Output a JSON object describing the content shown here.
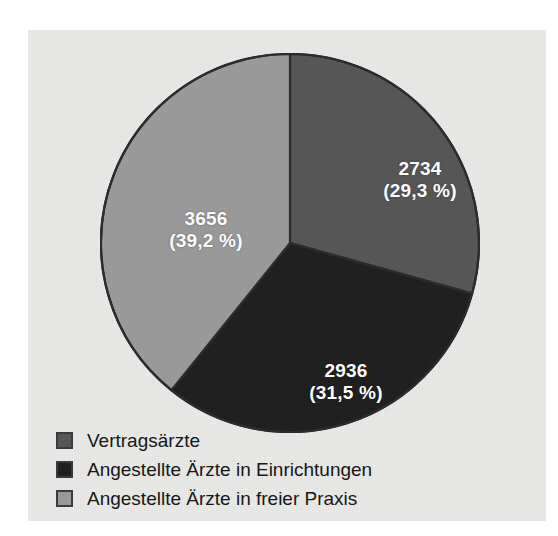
{
  "figure": {
    "background_color": "#e9e9e7",
    "page_color": "#ffffff"
  },
  "chart_data": {
    "type": "pie",
    "title": "",
    "subtitle": "",
    "xlabel": "",
    "ylabel": "",
    "legend_position": "bottom-left",
    "grid": false,
    "total": 9326,
    "categories": [
      "Vertragsärzte",
      "Angestellte Ärzte in Einrichtungen",
      "Angestellte Ärzte in freier Praxis"
    ],
    "values": [
      2734,
      2936,
      3656
    ],
    "percentages": [
      29.3,
      31.5,
      39.2
    ],
    "colors": [
      "#565656",
      "#1e1e1e",
      "#9a9a9a"
    ],
    "start_angle_deg": 0,
    "direction": "clockwise",
    "slices": [
      {
        "name": "Vertragsärzte",
        "value": 2734,
        "value_text": "2734",
        "percent": 29.3,
        "percent_text": "(29,3 %)",
        "color": "#565656",
        "label_color": "#ffffff"
      },
      {
        "name": "Angestellte Ärzte in Einrichtungen",
        "value": 2936,
        "value_text": "2936",
        "percent": 31.5,
        "percent_text": "(31,5 %)",
        "color": "#1e1e1e",
        "label_color": "#ffffff"
      },
      {
        "name": "Angestellte Ärzte in freier Praxis",
        "value": 3656,
        "value_text": "3656",
        "percent": 39.2,
        "percent_text": "(39,2 %)",
        "color": "#9a9a9a",
        "label_color": "#ffffff"
      }
    ]
  },
  "legend": {
    "items": [
      {
        "label": "Vertragsärzte",
        "color": "#565656"
      },
      {
        "label": "Angestellte Ärzte in Einrichtungen",
        "color": "#1e1e1e"
      },
      {
        "label": "Angestellte Ärzte in freier Praxis",
        "color": "#9a9a9a"
      }
    ]
  }
}
